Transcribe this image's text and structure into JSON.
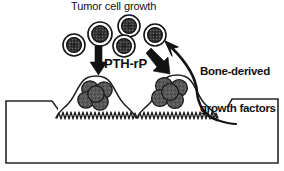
{
  "figure": {
    "type": "diagram",
    "title_label": "Tumor cell growth",
    "pthrp_label": "PTH-rP",
    "bone_factors_label": "Bone-derived\ngrowth factors",
    "bone_factors_line1": "Bone-derived",
    "bone_factors_line2": "growth factors"
  },
  "colors": {
    "outline": "#1a1a1a",
    "cell_fill": "#4d4d4d",
    "nucleus_fill": "#2b2b2b",
    "cell_ring": "#ffffff",
    "bone_fill": "#ffffff",
    "arrow_fill": "#111111",
    "text": "#111111",
    "background": "#ffffff"
  },
  "elements": {
    "free_tumor_cells": [
      {
        "name": "free-tumor-cell-1",
        "cx": 74,
        "cy": 45,
        "r": 11
      },
      {
        "name": "free-tumor-cell-2",
        "cx": 100,
        "cy": 34,
        "r": 12
      },
      {
        "name": "free-tumor-cell-3",
        "cx": 129,
        "cy": 26,
        "r": 11
      },
      {
        "name": "free-tumor-cell-4",
        "cx": 124,
        "cy": 46,
        "r": 11
      },
      {
        "name": "free-tumor-cell-5",
        "cx": 155,
        "cy": 35,
        "r": 11
      }
    ],
    "left_lesion_cells": [
      {
        "name": "lesion-cell-l1",
        "cx": 90,
        "cy": 89,
        "r": 8
      },
      {
        "name": "lesion-cell-l2",
        "cx": 104,
        "cy": 90,
        "r": 8
      },
      {
        "name": "lesion-cell-l3",
        "cx": 86,
        "cy": 100,
        "r": 8
      },
      {
        "name": "lesion-cell-l4",
        "cx": 99,
        "cy": 102,
        "r": 8
      },
      {
        "name": "lesion-cell-l5",
        "cx": 96,
        "cy": 95,
        "r": 8
      }
    ],
    "right_lesion_cells": [
      {
        "name": "lesion-cell-r1",
        "cx": 163,
        "cy": 87,
        "r": 8
      },
      {
        "name": "lesion-cell-r2",
        "cx": 178,
        "cy": 88,
        "r": 8
      },
      {
        "name": "lesion-cell-r3",
        "cx": 159,
        "cy": 99,
        "r": 8
      },
      {
        "name": "lesion-cell-r4",
        "cx": 173,
        "cy": 100,
        "r": 8
      },
      {
        "name": "lesion-cell-r5",
        "cx": 170,
        "cy": 93,
        "r": 8
      }
    ],
    "arrows": [
      {
        "name": "pthrp-arrow-down",
        "direction": "down"
      },
      {
        "name": "pthrp-arrow-diagonal",
        "direction": "down-right"
      },
      {
        "name": "bone-factors-curved-arrow",
        "direction": "up-left"
      }
    ],
    "bone": {
      "name": "bone-matrix",
      "left_surface_y": 101,
      "right_surface_y": 99,
      "base_y": 163
    },
    "osteoclasts": [
      {
        "name": "osteoclast-left",
        "ruffled_border": true
      },
      {
        "name": "osteoclast-right",
        "ruffled_border": true
      }
    ]
  }
}
